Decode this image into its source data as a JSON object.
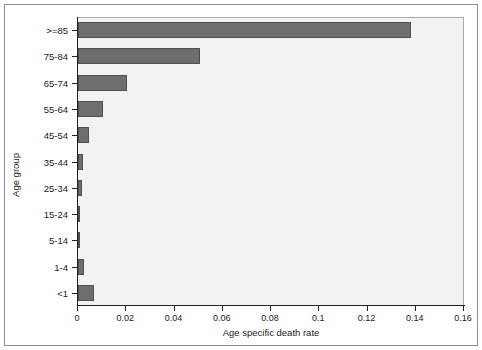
{
  "chart_data": {
    "type": "bar",
    "orientation": "horizontal",
    "title": "",
    "xlabel": "Age specific death rate",
    "ylabel": "Age group",
    "categories": [
      ">=85",
      "75-84",
      "65-74",
      "55-64",
      "45-54",
      "35-44",
      "25-34",
      "15-24",
      "5-14",
      "1-4",
      "<1"
    ],
    "values": [
      0.1382,
      0.0505,
      0.0202,
      0.0104,
      0.0046,
      0.0021,
      0.0016,
      0.0008,
      0.0002,
      0.0026,
      0.0067
    ],
    "xlim": [
      0,
      0.16
    ],
    "ylim_categories": 11,
    "xticks": [
      0,
      0.02,
      0.04,
      0.06,
      0.08,
      0.1,
      0.12,
      0.14,
      0.16
    ],
    "xtick_labels": [
      "0",
      "0.02",
      "0.04",
      "0.06",
      "0.08",
      "0.1",
      "0.12",
      "0.14",
      "0.16"
    ],
    "grid": false,
    "legend": null,
    "bar_color": "#6e6e6e",
    "bar_edge_color": "#4f4f4f",
    "plot_background": "#f2f2f2",
    "axis_color": "#1f1f1f",
    "figure_background": "#ffffff"
  }
}
